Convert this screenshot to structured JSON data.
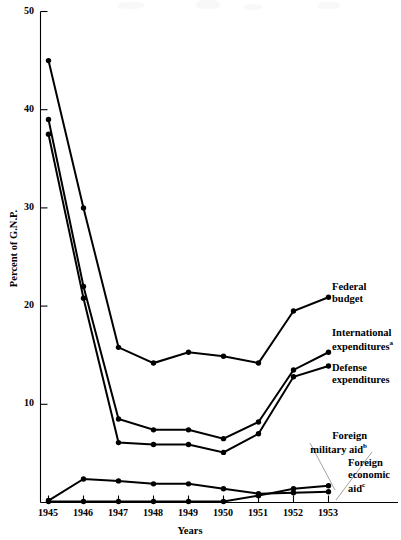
{
  "chart_data": {
    "type": "line",
    "title": "",
    "xlabel": "Years",
    "ylabel": "Percent of G.N.P.",
    "categories": [
      "1945",
      "1946",
      "1947",
      "1948",
      "1949",
      "1950",
      "1951",
      "1952",
      "1953"
    ],
    "x_ticks": [
      "1945",
      "1946",
      "1947",
      "1948",
      "1949",
      "1950",
      "1951",
      "1952",
      "1953"
    ],
    "y_ticks": [
      "0",
      "10",
      "20",
      "30",
      "40",
      "50"
    ],
    "ylim": [
      0,
      50
    ],
    "xlim": [
      "1945",
      "1953"
    ],
    "grid": false,
    "legend_position": "inline-right-annotations",
    "series": [
      {
        "name": "Federal budget",
        "label": "Federal budget",
        "values": [
          45.0,
          30.0,
          15.8,
          14.2,
          15.3,
          14.9,
          14.2,
          19.5,
          20.9
        ]
      },
      {
        "name": "International expenditures",
        "label": "International expenditures",
        "footnote": "a",
        "values": [
          39.0,
          22.0,
          8.5,
          7.4,
          7.4,
          6.5,
          8.2,
          13.5,
          15.3
        ]
      },
      {
        "name": "Defense expenditures",
        "label": "Defense expenditures",
        "footnote": "",
        "values": [
          37.5,
          20.8,
          6.1,
          5.9,
          5.9,
          5.1,
          7.0,
          12.8,
          13.9
        ]
      },
      {
        "name": "Foreign economic aid",
        "label": "Foreign economic aid",
        "footnote": "c",
        "values": [
          0.2,
          2.4,
          2.2,
          1.9,
          1.9,
          1.4,
          0.9,
          1.0,
          1.1
        ]
      },
      {
        "name": "Foreign military aid",
        "label": "Foreign military aid",
        "footnote": "b",
        "values": [
          0.1,
          0.1,
          0.1,
          0.1,
          0.1,
          0.1,
          0.7,
          1.4,
          1.7
        ]
      }
    ]
  },
  "annotations": {
    "federal": {
      "line1": "Federal",
      "line2": "budget"
    },
    "international": {
      "line1": "International",
      "line2": "expenditures",
      "sup": "a"
    },
    "defense": {
      "line1": "Defense",
      "line2": "expenditures"
    },
    "foreign_military": {
      "line1": "Foreign",
      "line2": "military aid",
      "sup": "b"
    },
    "foreign_economic": {
      "line1": "Foreign",
      "line2": "economic",
      "line3": "aid",
      "sup": "c"
    }
  },
  "axes": {
    "y_title": "Percent of G.N.P.",
    "x_title": "Years",
    "y_tick_labels": [
      "50",
      "40",
      "30",
      "20",
      "10"
    ],
    "x_tick_labels": [
      "1945",
      "1946",
      "1947",
      "1948",
      "1949",
      "1950",
      "1951",
      "1952",
      "1953"
    ]
  }
}
